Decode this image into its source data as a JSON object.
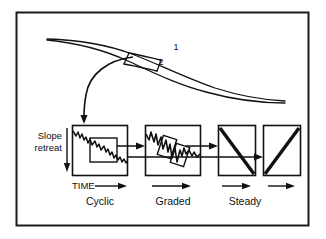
{
  "figure": {
    "frame": {
      "stroke_color": "#1a1a1a"
    },
    "upper_diagram": {
      "name": "hillslope-profile",
      "labels": [
        {
          "text": "1",
          "x": 176,
          "y": 50
        },
        {
          "text": "2",
          "x": 161,
          "y": 65
        }
      ]
    },
    "connector": {
      "name": "curved-arrow-to-cyclic-box",
      "description": "curved arrow from slope segment down to first time-series box"
    },
    "axes": {
      "y_label_line1": "Slope",
      "y_label_line2": "retreat",
      "x_label": "TIME"
    },
    "panels": [
      {
        "id": "cyclic",
        "label": "Cyclic",
        "x": 72,
        "y": 125,
        "width": 56,
        "height": 51,
        "trace": "jagged-descending-line",
        "inset_boxes": 1
      },
      {
        "id": "graded",
        "label": "Graded",
        "x": 145,
        "y": 125,
        "width": 56,
        "height": 51,
        "trace": "jagged-descending-line",
        "inset_boxes": 2
      },
      {
        "id": "steady-descending",
        "label": "Steady",
        "x": 218,
        "y": 125,
        "width": 38,
        "height": 51,
        "trace": "thick-descending-diagonal",
        "inset_boxes": 0
      },
      {
        "id": "steady-ascending",
        "label": "",
        "x": 263,
        "y": 125,
        "width": 38,
        "height": 51,
        "trace": "thick-ascending-diagonal",
        "inset_boxes": 0
      }
    ],
    "time_arrows": [
      {
        "id": "time-arrow-cyclic",
        "x1": 88,
        "x2": 126,
        "y": 186
      },
      {
        "id": "time-arrow-graded",
        "x1": 152,
        "x2": 190,
        "y": 186
      },
      {
        "id": "time-arrow-steady-1",
        "x1": 222,
        "x2": 250,
        "y": 186
      },
      {
        "id": "time-arrow-steady-2",
        "x1": 268,
        "x2": 296,
        "y": 186
      }
    ],
    "panel_captions": [
      {
        "text": "Cyclic",
        "x": 100,
        "y": 203
      },
      {
        "text": "Graded",
        "x": 173,
        "y": 203
      },
      {
        "text": "Steady",
        "x": 245,
        "y": 203
      }
    ]
  }
}
